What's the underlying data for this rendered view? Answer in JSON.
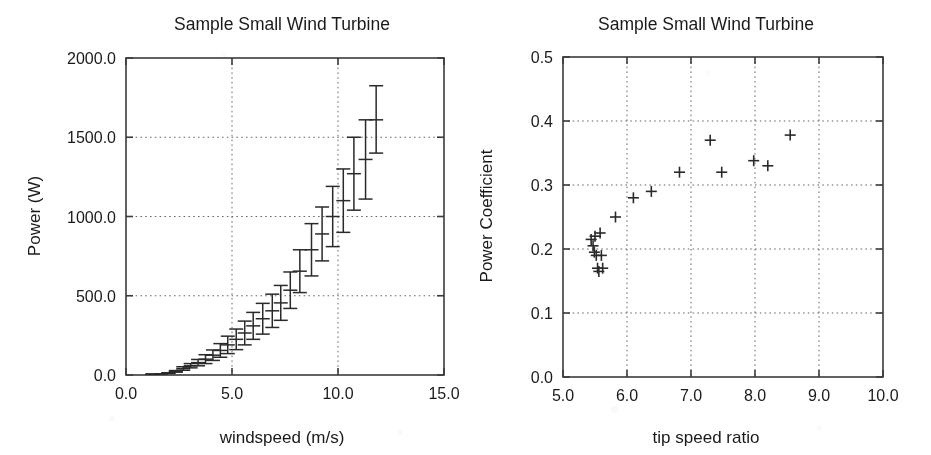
{
  "figure_left": {
    "title": "Sample Small Wind Turbine",
    "xlabel": "windspeed (m/s)",
    "ylabel": "Power (W)",
    "xticks": [
      "0.0",
      "5.0",
      "10.0",
      "15.0"
    ],
    "yticks": [
      "0.0",
      "500.0",
      "1000.0",
      "1500.0",
      "2000.0"
    ]
  },
  "figure_right": {
    "title": "Sample Small Wind Turbine",
    "xlabel": "tip speed ratio",
    "ylabel": "Power Coefficient",
    "xticks": [
      "5.0",
      "6.0",
      "7.0",
      "8.0",
      "9.0",
      "10.0"
    ],
    "yticks": [
      "0.0",
      "0.1",
      "0.2",
      "0.3",
      "0.4",
      "0.5"
    ]
  },
  "chart_data": [
    {
      "type": "line",
      "marker": "errorbar",
      "title": "Sample Small Wind Turbine",
      "xlabel": "windspeed (m/s)",
      "ylabel": "Power (W)",
      "xlim": [
        0.0,
        15.0
      ],
      "ylim": [
        0.0,
        2000.0
      ],
      "xticks": [
        0.0,
        5.0,
        10.0,
        15.0
      ],
      "yticks": [
        0.0,
        500.0,
        1000.0,
        1500.0,
        2000.0
      ],
      "grid": true,
      "legend": "none",
      "x": [
        1.25,
        1.65,
        2.0,
        2.35,
        2.7,
        3.05,
        3.4,
        3.75,
        4.1,
        4.45,
        4.8,
        5.2,
        5.6,
        6.0,
        6.45,
        6.9,
        7.3,
        7.75,
        8.2,
        8.75,
        9.25,
        9.75,
        10.25,
        10.75,
        11.3,
        11.8
      ],
      "y": [
        5,
        8,
        12,
        22,
        40,
        58,
        78,
        100,
        125,
        155,
        190,
        225,
        265,
        310,
        355,
        405,
        455,
        535,
        655,
        790,
        890,
        1000,
        1100,
        1270,
        1360,
        1610
      ],
      "yerr_low": [
        5,
        8,
        10,
        18,
        30,
        45,
        58,
        72,
        92,
        112,
        135,
        160,
        190,
        225,
        258,
        300,
        345,
        420,
        520,
        625,
        720,
        810,
        900,
        1040,
        1110,
        1400
      ],
      "yerr_high": [
        5,
        8,
        14,
        28,
        52,
        72,
        98,
        128,
        158,
        198,
        245,
        290,
        340,
        395,
        452,
        510,
        565,
        650,
        790,
        955,
        1060,
        1190,
        1300,
        1500,
        1610,
        1825
      ],
      "series": [
        {
          "name": "Power vs windspeed",
          "values": [
            5,
            8,
            12,
            22,
            40,
            58,
            78,
            100,
            125,
            155,
            190,
            225,
            265,
            310,
            355,
            405,
            455,
            535,
            655,
            790,
            890,
            1000,
            1100,
            1270,
            1360,
            1610
          ]
        }
      ]
    },
    {
      "type": "scatter",
      "marker": "plus",
      "title": "Sample Small Wind Turbine",
      "xlabel": "tip speed ratio",
      "ylabel": "Power Coefficient",
      "xlim": [
        5.0,
        10.0
      ],
      "ylim": [
        0.0,
        0.5
      ],
      "xticks": [
        5.0,
        6.0,
        7.0,
        8.0,
        9.0,
        10.0
      ],
      "yticks": [
        0.0,
        0.1,
        0.2,
        0.3,
        0.4,
        0.5
      ],
      "grid": true,
      "legend": "none",
      "x": [
        5.44,
        5.47,
        5.49,
        5.5,
        5.52,
        5.54,
        5.56,
        5.58,
        5.6,
        5.62,
        5.82,
        6.1,
        6.38,
        6.82,
        7.3,
        7.48,
        7.98,
        8.2,
        8.55
      ],
      "y": [
        0.215,
        0.205,
        0.195,
        0.22,
        0.19,
        0.17,
        0.165,
        0.225,
        0.19,
        0.17,
        0.25,
        0.28,
        0.29,
        0.32,
        0.37,
        0.32,
        0.338,
        0.33,
        0.378
      ],
      "series": [
        {
          "name": "Power coefficient vs tip speed ratio",
          "values": [
            0.215,
            0.205,
            0.195,
            0.22,
            0.19,
            0.17,
            0.165,
            0.225,
            0.19,
            0.17,
            0.25,
            0.28,
            0.29,
            0.32,
            0.37,
            0.32,
            0.338,
            0.33,
            0.378
          ]
        }
      ]
    }
  ]
}
